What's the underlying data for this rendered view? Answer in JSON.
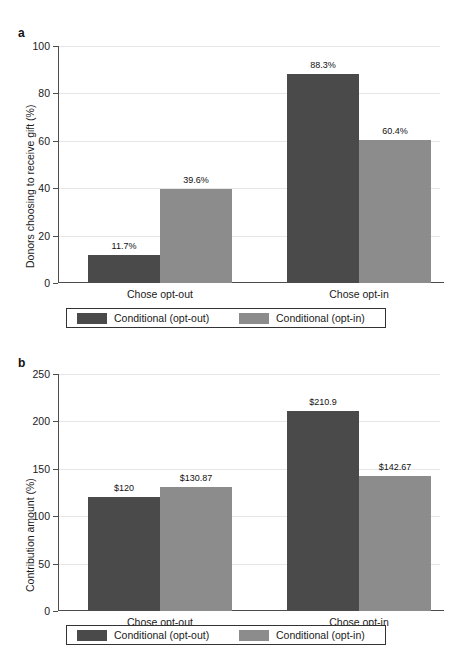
{
  "figure": {
    "panels": [
      {
        "letter": "a",
        "ylabel": "Donors choosing to receive gift (%)",
        "yticks": [
          "0",
          "20",
          "40",
          "60",
          "80",
          "100"
        ],
        "categories": [
          "Chose opt-out",
          "Chose opt-in"
        ],
        "bar_labels": [
          "11.7%",
          "39.6%",
          "88.3%",
          "60.4%"
        ],
        "legend": [
          "Conditional (opt-out)",
          "Conditional (opt-in)"
        ]
      },
      {
        "letter": "b",
        "ylabel": "Contribution amount (%)",
        "yticks": [
          "0",
          "50",
          "100",
          "150",
          "200",
          "250"
        ],
        "categories": [
          "Chose opt-out",
          "Chose opt-in"
        ],
        "bar_labels": [
          "$120",
          "$130.87",
          "$210.9",
          "$142.67"
        ],
        "legend": [
          "Conditional (opt-out)",
          "Conditional (opt-in)"
        ]
      }
    ],
    "colors": {
      "dark": "#4a4a4a",
      "light": "#8c8c8c",
      "axis": "#4d4d4d",
      "grid": "#e6e6e6"
    }
  },
  "chart_data": [
    {
      "type": "bar",
      "panel": "a",
      "title": "",
      "xlabel": "",
      "ylabel": "Donors choosing to receive gift (%)",
      "categories": [
        "Chose opt-out",
        "Chose opt-in"
      ],
      "ylim": [
        0,
        100
      ],
      "yticks": [
        0,
        20,
        40,
        60,
        80,
        100
      ],
      "grid": true,
      "legend_position": "below",
      "series": [
        {
          "name": "Conditional (opt-out)",
          "color": "#4a4a4a",
          "values": [
            11.7,
            88.3
          ],
          "labels": [
            "11.7%",
            "88.3%"
          ]
        },
        {
          "name": "Conditional (opt-in)",
          "color": "#8c8c8c",
          "values": [
            39.6,
            60.4
          ],
          "labels": [
            "39.6%",
            "60.4%"
          ]
        }
      ]
    },
    {
      "type": "bar",
      "panel": "b",
      "title": "",
      "xlabel": "",
      "ylabel": "Contribution amount (%)",
      "categories": [
        "Chose opt-out",
        "Chose opt-in"
      ],
      "ylim": [
        0,
        250
      ],
      "yticks": [
        0,
        50,
        100,
        150,
        200,
        250
      ],
      "grid": true,
      "legend_position": "below",
      "series": [
        {
          "name": "Conditional (opt-out)",
          "color": "#4a4a4a",
          "values": [
            120,
            210.9
          ],
          "labels": [
            "$120",
            "$210.9"
          ]
        },
        {
          "name": "Conditional (opt-in)",
          "color": "#8c8c8c",
          "values": [
            130.87,
            142.67
          ],
          "labels": [
            "$130.87",
            "$142.67"
          ]
        }
      ]
    }
  ]
}
